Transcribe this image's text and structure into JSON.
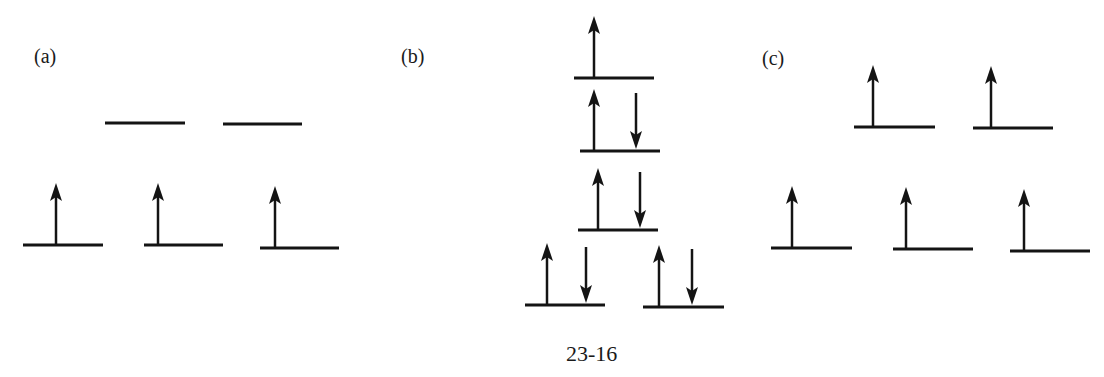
{
  "diagram": {
    "caption": "23-16",
    "line_color": "#141414",
    "panels": [
      {
        "id": "a",
        "label": "(a)",
        "label_pos": [
          34,
          46
        ],
        "levels": [
          {
            "x1": 105,
            "x2": 185,
            "y": 123,
            "electrons": []
          },
          {
            "x1": 223,
            "x2": 302,
            "y": 124,
            "electrons": []
          },
          {
            "x1": 23,
            "x2": 103,
            "y": 245,
            "electrons": [
              {
                "dir": "up",
                "x": 56
              }
            ]
          },
          {
            "x1": 144,
            "x2": 223,
            "y": 245,
            "electrons": [
              {
                "dir": "up",
                "x": 158
              }
            ]
          },
          {
            "x1": 260,
            "x2": 339,
            "y": 248,
            "electrons": [
              {
                "dir": "up",
                "x": 275
              }
            ]
          }
        ]
      },
      {
        "id": "b",
        "label": "(b)",
        "label_pos": [
          401,
          46
        ],
        "levels": [
          {
            "x1": 574,
            "x2": 654,
            "y": 78,
            "electrons": [
              {
                "dir": "up",
                "x": 594
              }
            ]
          },
          {
            "x1": 580,
            "x2": 660,
            "y": 151,
            "electrons": [
              {
                "dir": "up",
                "x": 594
              },
              {
                "dir": "down",
                "x": 636
              }
            ]
          },
          {
            "x1": 578,
            "x2": 658,
            "y": 230,
            "electrons": [
              {
                "dir": "up",
                "x": 598
              },
              {
                "dir": "down",
                "x": 640
              }
            ]
          },
          {
            "x1": 525,
            "x2": 605,
            "y": 305,
            "electrons": [
              {
                "dir": "up",
                "x": 547
              },
              {
                "dir": "down",
                "x": 586
              }
            ]
          },
          {
            "x1": 643,
            "x2": 724,
            "y": 307,
            "electrons": [
              {
                "dir": "up",
                "x": 659
              },
              {
                "dir": "down",
                "x": 692
              }
            ]
          }
        ]
      },
      {
        "id": "c",
        "label": "(c)",
        "label_pos": [
          762,
          48
        ],
        "levels": [
          {
            "x1": 854,
            "x2": 935,
            "y": 127,
            "electrons": [
              {
                "dir": "up",
                "x": 873
              }
            ]
          },
          {
            "x1": 973,
            "x2": 1053,
            "y": 128,
            "electrons": [
              {
                "dir": "up",
                "x": 991
              }
            ]
          },
          {
            "x1": 771,
            "x2": 852,
            "y": 248,
            "electrons": [
              {
                "dir": "up",
                "x": 792
              }
            ]
          },
          {
            "x1": 893,
            "x2": 973,
            "y": 249,
            "electrons": [
              {
                "dir": "up",
                "x": 906
              }
            ]
          },
          {
            "x1": 1010,
            "x2": 1090,
            "y": 251,
            "electrons": [
              {
                "dir": "up",
                "x": 1024
              }
            ]
          }
        ]
      }
    ],
    "caption_pos": [
      598,
      343
    ]
  }
}
